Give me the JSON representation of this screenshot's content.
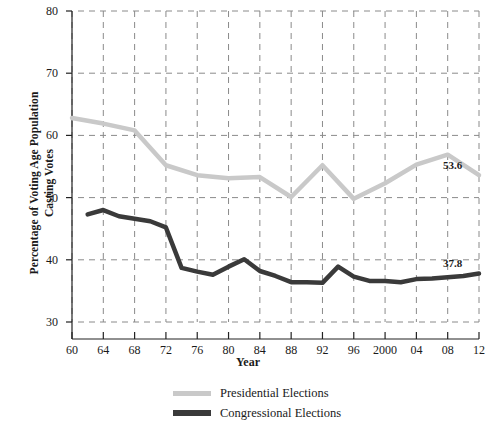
{
  "chart_data": {
    "type": "line",
    "title": "",
    "xlabel": "Year",
    "ylabel": "Percentage of Voting Age Population Casting Votes",
    "ylabel_line1": "Percentage of Voting Age Population",
    "ylabel_line2": "Casting Votes",
    "ylim": [
      30,
      80
    ],
    "xlim": [
      1960,
      2012
    ],
    "yticks": [
      30,
      40,
      50,
      60,
      70,
      80
    ],
    "ytick_labels": [
      "30",
      "40",
      "50",
      "60",
      "70",
      "80"
    ],
    "xticks": [
      1960,
      1964,
      1968,
      1972,
      1976,
      1980,
      1984,
      1988,
      1992,
      1996,
      2000,
      2004,
      2008,
      2012
    ],
    "xtick_labels": [
      "60",
      "64",
      "68",
      "72",
      "76",
      "80",
      "84",
      "88",
      "92",
      "96",
      "2000",
      "04",
      "08",
      "12"
    ],
    "grid": true,
    "grid_style": "dashed",
    "legend_position": "bottom",
    "series": [
      {
        "name": "Presidential Elections",
        "color": "#c9c9c9",
        "width": 4.5,
        "x": [
          1960,
          1964,
          1968,
          1972,
          1976,
          1980,
          1984,
          1988,
          1992,
          1996,
          2000,
          2004,
          2008,
          2012
        ],
        "values": [
          62.8,
          61.9,
          60.8,
          55.2,
          53.6,
          53.1,
          53.3,
          50.1,
          55.2,
          49.8,
          52.3,
          55.3,
          56.9,
          53.6
        ]
      },
      {
        "name": "Congressional Elections",
        "color": "#3a3a3a",
        "width": 4.5,
        "x": [
          1962,
          1964,
          1966,
          1968,
          1970,
          1972,
          1974,
          1976,
          1978,
          1980,
          1982,
          1984,
          1986,
          1988,
          1990,
          1992,
          1994,
          1996,
          1998,
          2000,
          2002,
          2004,
          2006,
          2008,
          2010,
          2012
        ],
        "values": [
          47.3,
          48.0,
          47.0,
          46.6,
          46.2,
          45.2,
          38.7,
          38.1,
          37.6,
          38.9,
          40.1,
          38.2,
          37.4,
          36.4,
          36.4,
          36.3,
          38.9,
          37.3,
          36.6,
          36.6,
          36.4,
          36.9,
          37.0,
          37.2,
          37.4,
          37.8
        ]
      }
    ],
    "annotations": [
      {
        "text": "53.6",
        "series": "Presidential Elections",
        "x": 2012,
        "y": 53.6
      },
      {
        "text": "37.8",
        "series": "Congressional Elections",
        "x": 2012,
        "y": 37.8
      }
    ]
  }
}
